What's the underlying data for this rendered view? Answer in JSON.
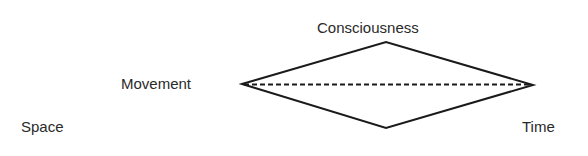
{
  "diagram": {
    "labels": {
      "consciousness": "Consciousness",
      "movement": "Movement",
      "space": "Space",
      "time": "Time"
    },
    "shape": {
      "type": "diamond",
      "left_vertex": [
        242,
        84
      ],
      "top_vertex": [
        386,
        42
      ],
      "right_vertex": [
        533,
        85
      ],
      "bottom_vertex": [
        386,
        128
      ],
      "axis_line": "dashed",
      "stroke_color": "#1a1a1a"
    }
  }
}
